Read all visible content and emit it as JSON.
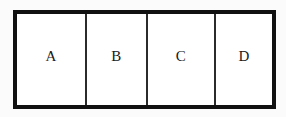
{
  "diagram": {
    "type": "partitioned-rectangle",
    "title": "",
    "background_color": "#fbfbfb",
    "fill_color": "#ffffff",
    "outer_border_color": "#111111",
    "outer_border_width_px": 4,
    "divider_color": "#2b2b2b",
    "divider_width_px": 2,
    "label_color": "#1a1a1a",
    "cells": [
      {
        "id": "a",
        "label": "A",
        "width_px": 68
      },
      {
        "id": "b",
        "label": "B",
        "width_px": 61
      },
      {
        "id": "c",
        "label": "C",
        "width_px": 68
      },
      {
        "id": "d",
        "label": "D",
        "width_px": 58
      }
    ]
  }
}
